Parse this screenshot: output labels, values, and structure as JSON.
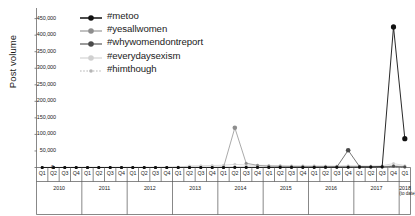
{
  "chart_data": {
    "type": "line",
    "title": "",
    "xlabel": "",
    "ylabel": "Post volume",
    "ylim": [
      0,
      470000
    ],
    "yticks": [
      0,
      50000,
      100000,
      150000,
      200000,
      250000,
      300000,
      350000,
      400000,
      450000
    ],
    "ytick_labels": [
      "0",
      "50,000",
      "100,000",
      "150,000",
      "200,000",
      "250,000",
      "300,000",
      "350,000",
      "400,000",
      "450,000"
    ],
    "grid": false,
    "legend_position": "top-left",
    "categories": [
      "Q1 2010",
      "Q2 2010",
      "Q3 2010",
      "Q4 2010",
      "Q1 2011",
      "Q2 2011",
      "Q3 2011",
      "Q4 2011",
      "Q1 2012",
      "Q2 2012",
      "Q3 2012",
      "Q4 2012",
      "Q1 2013",
      "Q2 2013",
      "Q3 2013",
      "Q4 2013",
      "Q1 2014",
      "Q2 2014",
      "Q3 2014",
      "Q4 2014",
      "Q1 2015",
      "Q2 2015",
      "Q3 2015",
      "Q4 2015",
      "Q1 2016",
      "Q2 2016",
      "Q3 2016",
      "Q4 2016",
      "Q1 2017",
      "Q2 2017",
      "Q3 2017",
      "Q4 2017",
      "Q1 2018"
    ],
    "quarter_ticks": [
      "Q1",
      "Q2",
      "Q3",
      "Q4",
      "Q1",
      "Q2",
      "Q3",
      "Q4",
      "Q1",
      "Q2",
      "Q3",
      "Q4",
      "Q1",
      "Q2",
      "Q3",
      "Q4",
      "Q1",
      "Q2",
      "Q3",
      "Q4",
      "Q1",
      "Q2",
      "Q3",
      "Q4",
      "Q1",
      "Q2",
      "Q3",
      "Q4",
      "Q1",
      "Q2",
      "Q3",
      "Q4",
      "Q1"
    ],
    "year_groups": [
      {
        "label": "2010",
        "sub": "",
        "quarters": 4
      },
      {
        "label": "2011",
        "sub": "",
        "quarters": 4
      },
      {
        "label": "2012",
        "sub": "",
        "quarters": 4
      },
      {
        "label": "2013",
        "sub": "",
        "quarters": 4
      },
      {
        "label": "2014",
        "sub": "",
        "quarters": 4
      },
      {
        "label": "2015",
        "sub": "",
        "quarters": 4
      },
      {
        "label": "2016",
        "sub": "",
        "quarters": 4
      },
      {
        "label": "2017",
        "sub": "",
        "quarters": 4
      },
      {
        "label": "2018",
        "sub": "(to date)",
        "quarters": 1
      }
    ],
    "series": [
      {
        "name": "#metoo",
        "color": "#111111",
        "marker": "filled-circle",
        "dash": "none",
        "values": [
          120,
          140,
          130,
          150,
          160,
          180,
          170,
          190,
          210,
          230,
          220,
          250,
          280,
          300,
          290,
          320,
          350,
          400,
          380,
          420,
          450,
          500,
          480,
          520,
          560,
          600,
          620,
          700,
          900,
          1200,
          2500,
          425000,
          87000
        ]
      },
      {
        "name": "#yesallwomen",
        "color": "#8e8e8e",
        "marker": "filled-circle",
        "dash": "none",
        "values": [
          0,
          0,
          0,
          0,
          0,
          0,
          0,
          0,
          0,
          0,
          0,
          0,
          0,
          0,
          0,
          0,
          600,
          120000,
          13000,
          6500,
          4200,
          3500,
          3000,
          2800,
          2600,
          2400,
          2200,
          2600,
          2100,
          2000,
          2300,
          5000,
          2600
        ]
      },
      {
        "name": "#whywomendontreport",
        "color": "#4a4a4a",
        "marker": "filled-circle",
        "dash": "none",
        "values": [
          0,
          0,
          0,
          0,
          0,
          0,
          0,
          0,
          0,
          0,
          0,
          0,
          0,
          0,
          0,
          0,
          0,
          0,
          0,
          0,
          0,
          0,
          0,
          0,
          300,
          600,
          1500,
          52000,
          3000,
          1800,
          1500,
          3500,
          1400
        ]
      },
      {
        "name": "#everydaysexism",
        "color": "#d0d0d0",
        "marker": "filled-circle",
        "dash": "none",
        "values": [
          0,
          0,
          0,
          0,
          0,
          0,
          0,
          0,
          0,
          0,
          0,
          0,
          1200,
          4500,
          5200,
          6000,
          7000,
          9500,
          7500,
          6800,
          6200,
          5800,
          5500,
          5200,
          5000,
          4800,
          4600,
          5400,
          4800,
          4500,
          5200,
          12000,
          5600
        ]
      },
      {
        "name": "#himthough",
        "color": "#b5b5b5",
        "marker": "small-circle",
        "dash": "dotted",
        "values": [
          0,
          0,
          0,
          0,
          0,
          0,
          0,
          0,
          0,
          0,
          0,
          0,
          0,
          0,
          0,
          0,
          0,
          0,
          0,
          0,
          0,
          0,
          0,
          0,
          0,
          0,
          0,
          0,
          0,
          0,
          0,
          1800,
          700
        ]
      }
    ]
  }
}
